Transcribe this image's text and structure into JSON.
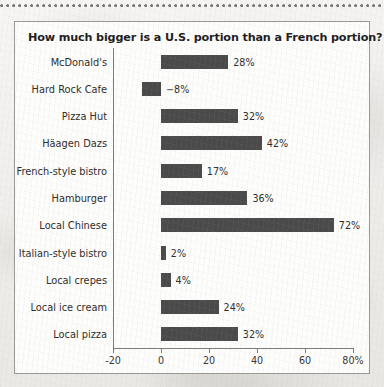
{
  "page": {
    "background_color": "#f2f1ef",
    "top_rule_color": "#6e6c69"
  },
  "card": {
    "background_color": "#fdfdfc",
    "border_color": "#9a9894"
  },
  "chart_data": {
    "type": "bar",
    "orientation": "horizontal",
    "title": "How much bigger is a U.S. portion than a French portion?",
    "xlabel": "",
    "ylabel": "",
    "xlim": [
      -20,
      80
    ],
    "grid": false,
    "legend": false,
    "bar_color": "#4a4a4a",
    "axis_color": "#7d7b78",
    "tick_values": [
      -20,
      0,
      20,
      40,
      60,
      80
    ],
    "tick_labels": [
      "-20",
      "0",
      "20",
      "40",
      "60",
      "80%"
    ],
    "categories": [
      "McDonald's",
      "Hard Rock Cafe",
      "Pizza Hut",
      "Häagen Dazs",
      "French-style bistro",
      "Hamburger",
      "Local Chinese",
      "Italian-style bistro",
      "Local crepes",
      "Local ice cream",
      "Local pizza"
    ],
    "values": [
      28,
      -8,
      32,
      42,
      17,
      36,
      72,
      2,
      4,
      24,
      32
    ],
    "value_labels": [
      "28%",
      "−8%",
      "32%",
      "42%",
      "17%",
      "36%",
      "72%",
      "2%",
      "4%",
      "24%",
      "32%"
    ]
  }
}
